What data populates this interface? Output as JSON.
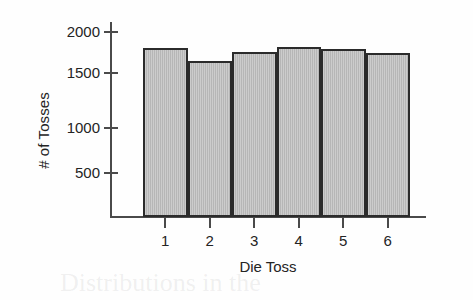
{
  "chart_data": {
    "type": "bar",
    "title": "",
    "xlabel": "Die Toss",
    "ylabel": "# of Tosses",
    "categories": [
      "1",
      "2",
      "3",
      "4",
      "5",
      "6"
    ],
    "values": [
      1690,
      1560,
      1655,
      1705,
      1680,
      1640
    ],
    "ylim": [
      0,
      2100
    ],
    "xlim": [
      0.5,
      6.5
    ],
    "yticks": [
      500,
      1000,
      1500,
      2000
    ],
    "ytick_labels": [
      "500",
      "1000",
      "1500",
      "2000"
    ],
    "xtick_labels": [
      "1",
      "2",
      "3",
      "4",
      "5",
      "6"
    ],
    "grid": false,
    "legend": false,
    "legend_position": "none",
    "bar_fill_color": "#b6b6b6",
    "bar_edge_color": "#2b2b2b",
    "axis_color": "#4a4a4a",
    "text_color": "#242424",
    "background_color": "#fefefe"
  },
  "ghost_text": {
    "line1": "tribution of",
    "line2": "Distributions in the"
  }
}
